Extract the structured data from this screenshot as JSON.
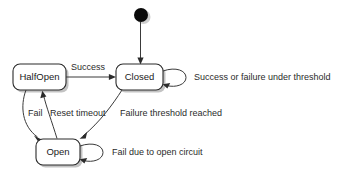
{
  "diagram": {
    "type": "uml-state-diagram",
    "background_color": "#ffffff",
    "line_color": "#3a3a3a",
    "text_color": "#2b2b2b",
    "state_fill_color": "#ffffff",
    "shadow_color": "#b8b8b8",
    "initial_node_color": "#0a0a0a",
    "initial_node": {
      "name": "initial-pseudostate",
      "cx": 141,
      "cy": 15,
      "r": 7
    },
    "states": [
      {
        "id": "halfopen",
        "label": "HalfOpen",
        "x": 13,
        "y": 64,
        "width": 53,
        "height": 26
      },
      {
        "id": "closed",
        "label": "Closed",
        "x": 116,
        "y": 64,
        "width": 47,
        "height": 26
      },
      {
        "id": "open",
        "label": "Open",
        "x": 36,
        "y": 139,
        "width": 44,
        "height": 26
      }
    ],
    "transitions": [
      {
        "id": "start-to-closed",
        "from": "initial",
        "to": "closed",
        "label": "",
        "kind": "straight-vertical"
      },
      {
        "id": "halfopen-to-closed",
        "from": "halfopen",
        "to": "closed",
        "label": "Success",
        "label_x": 71,
        "label_y": 70,
        "kind": "straight-horizontal"
      },
      {
        "id": "closed-self",
        "from": "closed",
        "to": "closed",
        "label": "Success or failure under threshold",
        "label_x": 194,
        "label_y": 80,
        "kind": "self-loop"
      },
      {
        "id": "closed-to-open",
        "from": "closed",
        "to": "open",
        "label": "Failure threshold reached",
        "label_x": 120,
        "label_y": 116,
        "kind": "curve"
      },
      {
        "id": "halfopen-to-open",
        "from": "halfopen",
        "to": "open",
        "label": "Fail",
        "label_x": 28,
        "label_y": 116,
        "kind": "curve"
      },
      {
        "id": "open-to-halfopen",
        "from": "open",
        "to": "halfopen",
        "label": "Reset timeout",
        "label_x": 50,
        "label_y": 116,
        "kind": "curve"
      },
      {
        "id": "open-self",
        "from": "open",
        "to": "open",
        "label": "Fail due to open circuit",
        "label_x": 112,
        "label_y": 155,
        "kind": "self-loop"
      }
    ]
  }
}
